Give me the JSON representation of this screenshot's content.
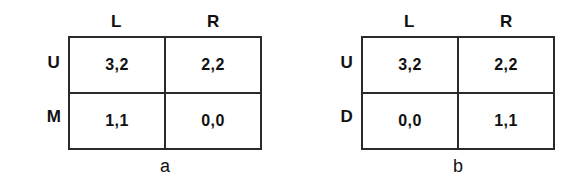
{
  "figure": {
    "panels": [
      {
        "caption": "a",
        "column_headers": [
          "L",
          "R"
        ],
        "row_labels": [
          "U",
          "M"
        ],
        "cells": [
          [
            "3,2",
            "2,2"
          ],
          [
            "1,1",
            "0,0"
          ]
        ]
      },
      {
        "caption": "b",
        "column_headers": [
          "L",
          "R"
        ],
        "row_labels": [
          "U",
          "D"
        ],
        "cells": [
          [
            "3,2",
            "2,2"
          ],
          [
            "0,0",
            "1,1"
          ]
        ]
      }
    ]
  },
  "colors": {
    "background": "#ffffff",
    "border": "#2a2a2a",
    "text": "#111111"
  }
}
